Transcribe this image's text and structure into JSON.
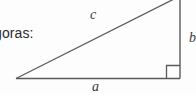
{
  "figure": {
    "name": "right-triangle-pythagoras",
    "caption": "goras:",
    "background_color": "#fdfdfd",
    "stroke_color": "#5a5a5a",
    "text_color": "#2b2b2b",
    "label_color": "#3a3a3a"
  },
  "labels": {
    "hypotenuse": "c",
    "base": "a",
    "height": "b"
  },
  "geometry": {
    "apex_x": 16,
    "apex_y": 79,
    "corner_x": 180,
    "corner_y": 79,
    "top_x": 180,
    "top_y": 0,
    "right_angle_size": 13
  }
}
